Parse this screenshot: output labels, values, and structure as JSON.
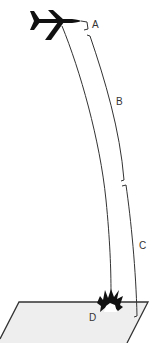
{
  "diagram": {
    "type": "aircraft-descent-phases",
    "colors": {
      "line": "#333333",
      "aircraft": "#111111",
      "ground_fill": "#eeeeee",
      "ground_stroke": "#333333",
      "explosion": "#111111",
      "background": "#ffffff"
    },
    "labels": {
      "a": "A",
      "b": "B",
      "c": "C",
      "d": "D"
    },
    "elements": [
      {
        "id": "aircraft",
        "icon": "airplane-icon"
      },
      {
        "id": "trajectory",
        "description": "curved descent path"
      },
      {
        "id": "segment-a",
        "label": "A"
      },
      {
        "id": "segment-b",
        "label": "B"
      },
      {
        "id": "segment-c",
        "label": "C"
      },
      {
        "id": "impact",
        "icon": "explosion-icon",
        "label": "D"
      },
      {
        "id": "ground",
        "description": "ground plane"
      }
    ]
  }
}
